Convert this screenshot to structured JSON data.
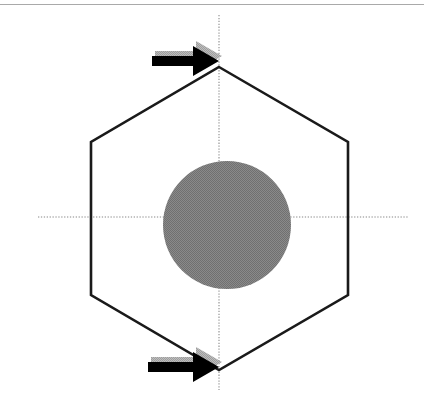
{
  "figure": {
    "canvas": {
      "width": 424,
      "height": 412,
      "background": "#ffffff"
    },
    "top_rule": {
      "name": "top-border-rule",
      "color": "#a9a9a9",
      "y": 4,
      "thickness": 1
    },
    "axes": {
      "style": "dotted",
      "color": "#b0b0b0",
      "thickness": 1.6,
      "vertical": {
        "x": 219,
        "y1": 15,
        "y2": 390
      },
      "horizontal": {
        "y": 217,
        "x1": 38,
        "x2": 408
      }
    },
    "hexagon": {
      "name": "hexagon-outline",
      "orientation": "pointy-top",
      "stroke": "#1a1a1a",
      "stroke_width": 2.6,
      "fill": "none",
      "vertices": [
        {
          "label": "top",
          "x": 219,
          "y": 67
        },
        {
          "label": "upper-right",
          "x": 348,
          "y": 142
        },
        {
          "label": "lower-right",
          "x": 348,
          "y": 295
        },
        {
          "label": "bottom",
          "x": 219,
          "y": 370
        },
        {
          "label": "lower-left",
          "x": 91,
          "y": 295
        },
        {
          "label": "upper-left",
          "x": 91,
          "y": 142
        }
      ]
    },
    "circle": {
      "name": "inscribed-circle",
      "center_x": 227,
      "center_y": 225,
      "radius": 64,
      "fill": "#808080",
      "texture": "dithered-halftone"
    },
    "arrows": [
      {
        "name": "arrow-top",
        "label": "",
        "direction": "right",
        "color": "#000000",
        "shadow_color": "#aaaaaa",
        "tail_x": 152,
        "tip_x": 219,
        "center_y": 61,
        "shaft_thickness": 10,
        "head_length": 26,
        "head_half_height": 15,
        "target_vertex": "top"
      },
      {
        "name": "arrow-bottom",
        "label": "",
        "direction": "right",
        "color": "#000000",
        "shadow_color": "#aaaaaa",
        "tail_x": 148,
        "tip_x": 219,
        "center_y": 367,
        "shaft_thickness": 10,
        "head_length": 26,
        "head_half_height": 15,
        "target_vertex": "bottom"
      }
    ]
  }
}
